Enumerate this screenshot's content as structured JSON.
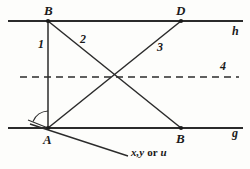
{
  "figure": {
    "width": 250,
    "height": 169,
    "stroke_color": "#2b2b2b",
    "background": "#fdfdfb"
  },
  "lines": {
    "h": {
      "label": "h",
      "style": "solid",
      "y": 21,
      "x1": 8,
      "x2": 243
    },
    "g": {
      "label": "g",
      "style": "solid",
      "y": 128,
      "x1": 8,
      "x2": 243
    },
    "dashed": {
      "label": "4",
      "style": "dashed",
      "y": 77,
      "x1": 20,
      "x2": 239
    }
  },
  "points": {
    "top_left": {
      "label": "B",
      "x": 48,
      "y": 21
    },
    "top_right": {
      "label": "D",
      "x": 181,
      "y": 21
    },
    "bottom_left": {
      "label": "A",
      "x": 48,
      "y": 128
    },
    "bottom_right": {
      "label": "B",
      "x": 181,
      "y": 128
    }
  },
  "segments": {
    "vertical": {
      "label": "1",
      "from": "B(top)",
      "to": "A",
      "label_x": 41,
      "label_y": 39
    },
    "diagonal_b_to_bottom_right": {
      "label": "2",
      "from": "B(top)",
      "to": "B(bottom)",
      "label_x": 82,
      "label_y": 34
    },
    "diagonal_a_to_d": {
      "label": "3",
      "from": "A",
      "to": "D",
      "label_x": 159,
      "label_y": 42
    }
  },
  "angle_marker": {
    "name": "angle-at-A",
    "vertex": "A",
    "has_arc": true,
    "has_dot": true
  },
  "ray": {
    "name": "ray-from-A",
    "label": "x,y or u",
    "label_italic_1": "x,y",
    "label_roman": "or",
    "label_italic_2": "u",
    "label_x": 130,
    "label_y": 147
  }
}
